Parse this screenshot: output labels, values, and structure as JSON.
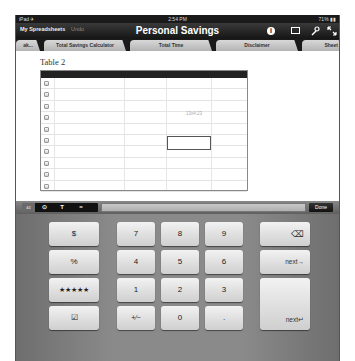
{
  "status_bar": {
    "carrier": "iPad ✈",
    "time": "2:54 PM",
    "battery": "71% ▮▮"
  },
  "toolbar": {
    "my_spreadsheets": "My Spreadsheets",
    "undo": "Undo",
    "title": "Personal Savings",
    "icons": [
      "info-icon",
      "image-icon",
      "wrench-icon",
      "fullscreen-icon"
    ],
    "icon_glyphs": {
      "info": "i",
      "image": "",
      "wrench": "🔧",
      "fullscreen": "⤡"
    }
  },
  "tabs": [
    {
      "label": "ak..."
    },
    {
      "label": "Total Savings Calculator"
    },
    {
      "label": "Total Time"
    },
    {
      "label": "Disclaimer"
    },
    {
      "label": "Sheet"
    }
  ],
  "sheet": {
    "table_title": "Table 2",
    "row_count": 10,
    "faint_text": "13x4:23"
  },
  "formula_bar": {
    "buttons": [
      "42",
      "⊙",
      "T",
      "="
    ],
    "input_value": "",
    "done_label": "Done"
  },
  "keypad": {
    "left_keys": [
      "$",
      "%",
      "★★★★★",
      "☑"
    ],
    "digits": [
      "7",
      "8",
      "9",
      "4",
      "5",
      "6",
      "1",
      "2",
      "3",
      "+⁄−",
      "0",
      "."
    ],
    "delete_glyph": "⌫",
    "next_right": "next→",
    "next_return": "next↵"
  }
}
